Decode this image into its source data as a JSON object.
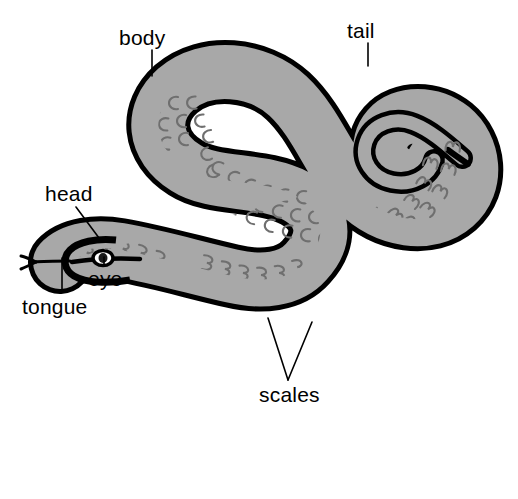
{
  "diagram": {
    "background_color": "#ffffff",
    "body_fill_color": "#a8a8a8",
    "outline_color": "#000000",
    "scale_mark_color": "#6f6f6f",
    "label_text_color": "#000000",
    "leader_line_color": "#000000"
  },
  "labels": {
    "body": "body",
    "tail": "tail",
    "head": "head",
    "eye": "eye",
    "tongue": "tongue",
    "scales": "scales"
  },
  "parts": [
    {
      "key": "body",
      "label": "body",
      "leader": "vertical"
    },
    {
      "key": "tail",
      "label": "tail",
      "leader": "vertical"
    },
    {
      "key": "head",
      "label": "head",
      "leader": "diagonal"
    },
    {
      "key": "eye",
      "label": "eye",
      "leader": "vertical"
    },
    {
      "key": "tongue",
      "label": "tongue",
      "leader": "vertical"
    },
    {
      "key": "scales",
      "label": "scales",
      "leader": "forked"
    }
  ]
}
